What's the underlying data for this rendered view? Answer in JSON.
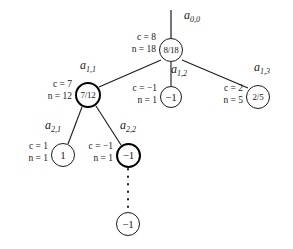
{
  "figure": {
    "type": "tree-diagram",
    "background_color": "#ffffff",
    "line_color": "#1a1a1a",
    "highlight_color": "#000000"
  },
  "nodes": [
    {
      "id": "root",
      "name": "a",
      "subscript": "0,0",
      "value_label": "8/18",
      "c": "c = 8",
      "n": "n = 18",
      "highlighted": false
    },
    {
      "id": "a11",
      "name": "a",
      "subscript": "1,1",
      "value_label": "7/12",
      "c": "c = 7",
      "n": "n = 12",
      "highlighted": true
    },
    {
      "id": "a12",
      "name": "a",
      "subscript": "1,2",
      "value_label": "−1",
      "c": "c = −1",
      "n": "n = 1",
      "highlighted": false
    },
    {
      "id": "a13",
      "name": "a",
      "subscript": "1,3",
      "value_label": "2/5",
      "c": "c = 2",
      "n": "n = 5",
      "highlighted": false
    },
    {
      "id": "a21",
      "name": "a",
      "subscript": "2,1",
      "value_label": "1",
      "c": "c = 1",
      "n": "n = 1",
      "highlighted": false
    },
    {
      "id": "a22",
      "name": "a",
      "subscript": "2,2",
      "value_label": "−1",
      "c": "c = −1",
      "n": "n = 1",
      "highlighted": true
    },
    {
      "id": "leaf",
      "name": "",
      "subscript": "",
      "value_label": "−1",
      "c": "",
      "n": "",
      "highlighted": false
    }
  ],
  "edges": [
    {
      "from": "stem-top",
      "to": "root",
      "style": "solid"
    },
    {
      "from": "root",
      "to": "a11",
      "style": "solid"
    },
    {
      "from": "root",
      "to": "a12",
      "style": "solid"
    },
    {
      "from": "root",
      "to": "a13",
      "style": "solid"
    },
    {
      "from": "a11",
      "to": "a21",
      "style": "solid"
    },
    {
      "from": "a11",
      "to": "a22",
      "style": "solid"
    },
    {
      "from": "a22",
      "to": "leaf",
      "style": "dotted"
    }
  ]
}
